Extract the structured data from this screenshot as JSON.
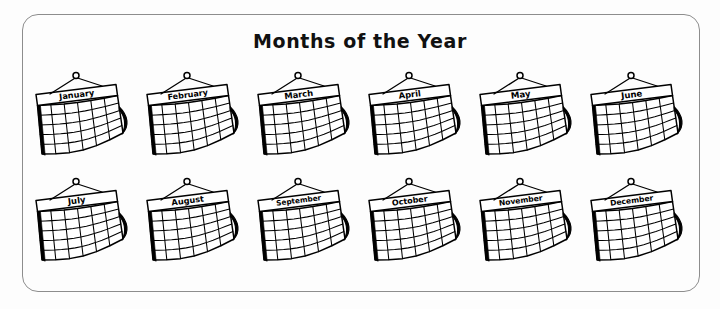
{
  "worksheet": {
    "title": "Months of the Year",
    "frame_color": "#8d8d8d",
    "ink_color": "#000000",
    "background_color": "#fdfdfd",
    "columns": 6,
    "rows": 2
  },
  "calendar_art": {
    "icon_name": "wall-calendar-icon",
    "grid_columns": 6,
    "grid_rows": 5,
    "has_hanging_hook": true,
    "has_curled_corner": true
  },
  "months": [
    {
      "label": "January",
      "index": 1,
      "font_size": 8.2
    },
    {
      "label": "February",
      "index": 2,
      "font_size": 8.0
    },
    {
      "label": "March",
      "index": 3,
      "font_size": 8.4
    },
    {
      "label": "April",
      "index": 4,
      "font_size": 8.4
    },
    {
      "label": "May",
      "index": 5,
      "font_size": 8.6
    },
    {
      "label": "June",
      "index": 6,
      "font_size": 8.6
    },
    {
      "label": "July",
      "index": 7,
      "font_size": 8.6
    },
    {
      "label": "August",
      "index": 8,
      "font_size": 8.2
    },
    {
      "label": "September",
      "index": 9,
      "font_size": 7.3
    },
    {
      "label": "October",
      "index": 10,
      "font_size": 8.0
    },
    {
      "label": "November",
      "index": 11,
      "font_size": 7.6
    },
    {
      "label": "December",
      "index": 12,
      "font_size": 7.6
    }
  ]
}
